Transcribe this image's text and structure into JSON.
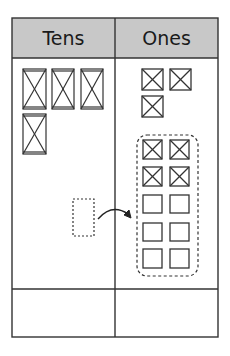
{
  "table": {
    "headers": {
      "tens": "Tens",
      "ones": "Ones"
    },
    "header_bg": "#c8c8c8",
    "line_color": "#333333"
  },
  "tens_column": {
    "rods_count": 4,
    "rods": [
      {
        "x": 23,
        "y": 69,
        "w": 23,
        "h": 40
      },
      {
        "x": 52,
        "y": 69,
        "w": 22,
        "h": 40
      },
      {
        "x": 81,
        "y": 69,
        "w": 22,
        "h": 40
      },
      {
        "x": 23,
        "y": 114,
        "w": 23,
        "h": 40
      }
    ],
    "dashed_rod_outline": {
      "x": 73,
      "y": 199,
      "w": 21,
      "h": 37,
      "meaning": "ten regrouped into ones"
    }
  },
  "ones_column": {
    "cubes_count": 3,
    "cubes": [
      {
        "x": 142,
        "y": 69,
        "size": 21
      },
      {
        "x": 170,
        "y": 69,
        "size": 21
      },
      {
        "x": 142,
        "y": 96,
        "size": 21
      }
    ],
    "regrouped_group": {
      "outline": {
        "x": 137,
        "y": 135,
        "w": 61,
        "h": 141
      },
      "crossed_count": 4,
      "empty_count": 6,
      "cubes": [
        {
          "x": 143,
          "y": 140,
          "crossed": true
        },
        {
          "x": 170,
          "y": 140,
          "crossed": true
        },
        {
          "x": 143,
          "y": 167,
          "crossed": true
        },
        {
          "x": 170,
          "y": 167,
          "crossed": true
        },
        {
          "x": 143,
          "y": 195,
          "crossed": false
        },
        {
          "x": 170,
          "y": 195,
          "crossed": false
        },
        {
          "x": 143,
          "y": 223,
          "crossed": false
        },
        {
          "x": 170,
          "y": 223,
          "crossed": false
        },
        {
          "x": 143,
          "y": 249,
          "crossed": false
        },
        {
          "x": 170,
          "y": 249,
          "crossed": false
        }
      ]
    }
  },
  "arrow": {
    "from": "tens",
    "to": "ones",
    "meaning": "regroup 1 ten as 10 ones"
  },
  "answer_row": {
    "tens": "",
    "ones": ""
  }
}
